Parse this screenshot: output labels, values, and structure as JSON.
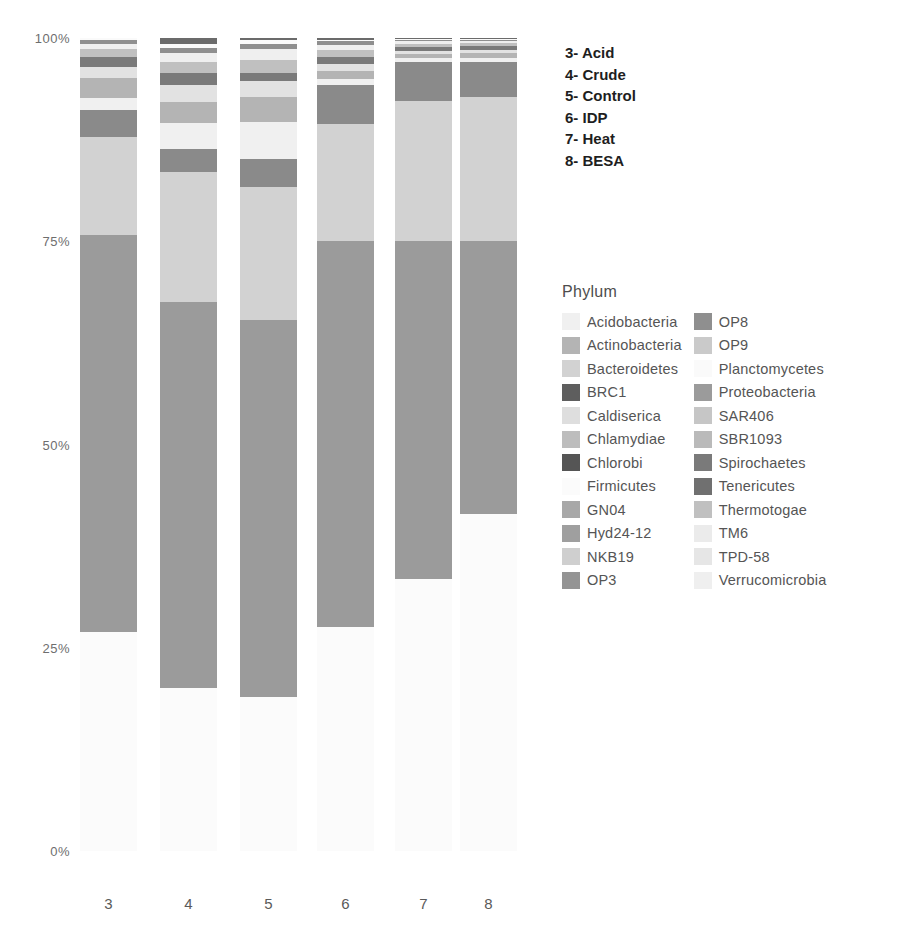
{
  "chart_data": {
    "type": "bar",
    "title": "",
    "subtitle": "",
    "xlabel": "",
    "ylabel": "",
    "stacked": true,
    "normalized": true,
    "grid": false,
    "legend_position": "right",
    "ylim": [
      0,
      100
    ],
    "yticks": [
      "0%",
      "25%",
      "50%",
      "75%",
      "100%"
    ],
    "ytick_values": [
      0,
      25,
      50,
      75,
      100
    ],
    "categories": [
      "3",
      "4",
      "5",
      "6",
      "7",
      "8"
    ],
    "category_names": [
      "Acid",
      "Crude",
      "Control",
      "IDP",
      "Heat",
      "BESA"
    ],
    "legend_title": "Phylum",
    "series": [
      {
        "name": "Firmicutes",
        "color": "#fbfbfb",
        "values": [
          27.0,
          20.0,
          19.0,
          27.5,
          33.5,
          41.5
        ]
      },
      {
        "name": "Proteobacteria",
        "color": "#9b9b9b",
        "values": [
          48.8,
          47.5,
          46.3,
          47.5,
          41.5,
          33.5
        ]
      },
      {
        "name": "Bacteroidetes",
        "color": "#d2d2d2",
        "values": [
          12.0,
          16.0,
          16.4,
          14.4,
          17.2,
          17.7
        ]
      },
      {
        "name": "Tenericutes",
        "color": "#8a8a8a",
        "values": [
          3.3,
          2.8,
          3.4,
          4.8,
          4.9,
          4.3
        ]
      },
      {
        "name": "Acidobacteria",
        "color": "#f0f0f0",
        "values": [
          1.5,
          3.2,
          4.6,
          0.7,
          0.4,
          0.5
        ]
      },
      {
        "name": "Actinobacteria",
        "color": "#b4b4b4",
        "values": [
          2.5,
          2.6,
          3.0,
          1.1,
          0.5,
          0.6
        ]
      },
      {
        "name": "Chloroflexi",
        "color": "#e2e2e2",
        "values": [
          1.3,
          2.1,
          2.0,
          0.8,
          0.4,
          0.4
        ]
      },
      {
        "name": "Spirochaetes",
        "color": "#7a7a7a",
        "values": [
          1.3,
          1.5,
          1.0,
          0.9,
          0.5,
          0.5
        ]
      },
      {
        "name": "Thermotogae",
        "color": "#c0c0c0",
        "values": [
          0.9,
          1.4,
          1.6,
          0.8,
          0.4,
          0.4
        ]
      },
      {
        "name": "Verrucomicrobia",
        "color": "#efefef",
        "values": [
          0.7,
          1.0,
          1.3,
          0.6,
          0.3,
          0.3
        ]
      },
      {
        "name": "OP8",
        "color": "#8f8f8f",
        "values": [
          0.4,
          0.7,
          0.7,
          0.5,
          0.2,
          0.1
        ]
      },
      {
        "name": "Planctomycetes",
        "color": "#fafafa",
        "values": [
          0.3,
          0.5,
          0.4,
          0.2,
          0.1,
          0.1
        ]
      },
      {
        "name": "Chlorobi",
        "color": "#6b6b6b",
        "values": [
          0.0,
          0.7,
          0.3,
          0.2,
          0.1,
          0.1
        ]
      }
    ],
    "annotations": [
      "3- Acid",
      "4- Crude",
      "5- Control",
      "6- IDP",
      "7- Heat",
      "8- BESA"
    ],
    "legend_entries_left": [
      {
        "label": "Acidobacteria",
        "color": "#f0f0f0"
      },
      {
        "label": "Actinobacteria",
        "color": "#b4b4b4"
      },
      {
        "label": "Bacteroidetes",
        "color": "#d2d2d2"
      },
      {
        "label": "BRC1",
        "color": "#5e5e5e"
      },
      {
        "label": "Caldiserica",
        "color": "#dedede"
      },
      {
        "label": "Chlamydiae",
        "color": "#bdbdbd"
      },
      {
        "label": "Chlorobi",
        "color": "#555555"
      },
      {
        "label": "Firmicutes",
        "color": "#fbfbfb"
      },
      {
        "label": "GN04",
        "color": "#a8a8a8"
      },
      {
        "label": "Hyd24-12",
        "color": "#9f9f9f"
      },
      {
        "label": "NKB19",
        "color": "#cfcfcf"
      },
      {
        "label": "OP3",
        "color": "#949494"
      }
    ],
    "legend_entries_right": [
      {
        "label": "OP8",
        "color": "#8f8f8f"
      },
      {
        "label": "OP9",
        "color": "#cacaca"
      },
      {
        "label": "Planctomycetes",
        "color": "#fafafa"
      },
      {
        "label": "Proteobacteria",
        "color": "#9b9b9b"
      },
      {
        "label": "SAR406",
        "color": "#c6c6c6"
      },
      {
        "label": "SBR1093",
        "color": "#bababa"
      },
      {
        "label": "Spirochaetes",
        "color": "#7a7a7a"
      },
      {
        "label": "Tenericutes",
        "color": "#707070"
      },
      {
        "label": "Thermotogae",
        "color": "#c0c0c0"
      },
      {
        "label": "TM6",
        "color": "#ebebeb"
      },
      {
        "label": "TPD-58",
        "color": "#e6e6e6"
      },
      {
        "label": "Verrucomicrobia",
        "color": "#efefef"
      }
    ]
  }
}
